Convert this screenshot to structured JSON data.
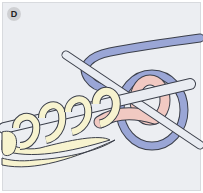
{
  "figure": {
    "step_label": "D",
    "colors": {
      "background": "#eceef2",
      "badge": "#cfd0d3",
      "yarn_cream": "#f7f3cf",
      "yarn_blue": "#9aa6d6",
      "yarn_pink": "#f1c9c2",
      "hook": "#e9ecf2",
      "outline": "#3b3f4a"
    }
  }
}
